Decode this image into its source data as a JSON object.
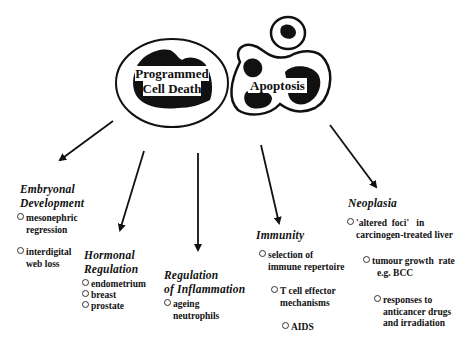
{
  "diagram": {
    "nodes": {
      "programmed_cell_death": {
        "line1": "Programmed",
        "line2": "Cell Death"
      },
      "apoptosis": {
        "label": "Apoptosis"
      }
    },
    "branches": [
      {
        "heading_line1": "Embryonal",
        "heading_line2": "Development",
        "items": [
          {
            "line1": "mesonephric",
            "line2": "regression"
          },
          {
            "line1": "interdigital",
            "line2": "web loss"
          }
        ]
      },
      {
        "heading_line1": "Hormonal",
        "heading_line2": "Regulation",
        "items": [
          {
            "line1": "endometrium"
          },
          {
            "line1": "breast"
          },
          {
            "line1": "prostate"
          }
        ]
      },
      {
        "heading_line1": "Regulation",
        "heading_line2": "of Inflammation",
        "items": [
          {
            "line1": "ageing",
            "line2": "neutrophils"
          }
        ]
      },
      {
        "heading_line1": "Immunity",
        "items": [
          {
            "line1": "selection of",
            "line2": "immune repertoire"
          },
          {
            "line1": "T cell effector",
            "line2": "mechanisms"
          },
          {
            "line1": "AIDS"
          }
        ]
      },
      {
        "heading_line1": "Neoplasia",
        "items": [
          {
            "line1": "'altered  foci'   in",
            "line2": "carcinogen-treated liver"
          },
          {
            "line1": "tumour growth  rate",
            "line2": "e.g. BCC"
          },
          {
            "line1": "responses to",
            "line2": "anticancer drugs",
            "line3": "and irradiation"
          }
        ]
      }
    ]
  }
}
